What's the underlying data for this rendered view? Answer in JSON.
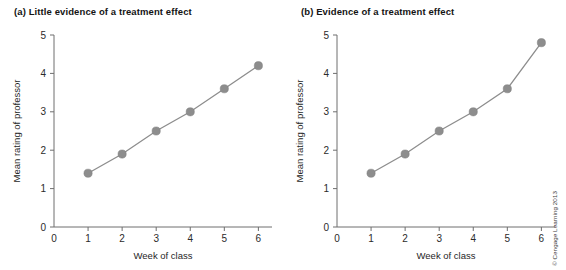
{
  "figure": {
    "credit": "© Cengage Learning 2013"
  },
  "panels": [
    {
      "label": "(a)",
      "title": "(a) Little evidence of a treatment effect"
    },
    {
      "label": "(b)",
      "title": "(b) Evidence of a treatment effect"
    }
  ],
  "chart_data": [
    {
      "type": "line",
      "title": "(a) Little evidence of a treatment effect",
      "xlabel": "Week of class",
      "ylabel": "Mean rating of professor",
      "x": [
        1,
        2,
        3,
        4,
        5,
        6
      ],
      "values": [
        1.4,
        1.9,
        2.5,
        3.0,
        3.6,
        4.2
      ],
      "xlim": [
        0,
        6.4
      ],
      "ylim": [
        0,
        5
      ],
      "xticks": [
        0,
        1,
        2,
        3,
        4,
        5,
        6
      ],
      "yticks": [
        0,
        1,
        2,
        3,
        4,
        5
      ],
      "xticklabels": [
        "0",
        "1",
        "2",
        "3",
        "4",
        "5",
        "6"
      ],
      "yticklabels": [
        "0",
        "1",
        "2",
        "3",
        "4",
        "5"
      ],
      "grid": false,
      "legend": false,
      "marker": "circle",
      "color": "#8d8d8d"
    },
    {
      "type": "line",
      "title": "(b) Evidence of a treatment effect",
      "xlabel": "Week of class",
      "ylabel": "Mean rating of professor",
      "x": [
        1,
        2,
        3,
        4,
        5,
        6
      ],
      "values": [
        1.4,
        1.9,
        2.5,
        3.0,
        3.6,
        4.8
      ],
      "xlim": [
        0,
        6.4
      ],
      "ylim": [
        0,
        5
      ],
      "xticks": [
        0,
        1,
        2,
        3,
        4,
        5,
        6
      ],
      "yticks": [
        0,
        1,
        2,
        3,
        4,
        5
      ],
      "xticklabels": [
        "0",
        "1",
        "2",
        "3",
        "4",
        "5",
        "6"
      ],
      "yticklabels": [
        "0",
        "1",
        "2",
        "3",
        "4",
        "5"
      ],
      "grid": false,
      "legend": false,
      "marker": "circle",
      "color": "#8d8d8d"
    }
  ]
}
